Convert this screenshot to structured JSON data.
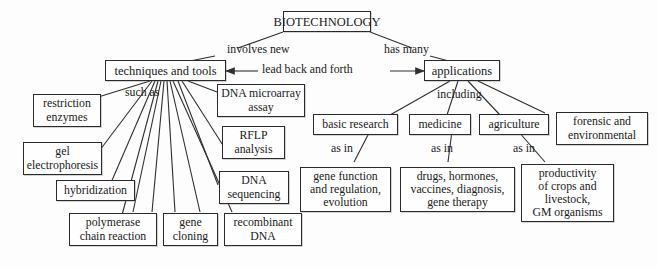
{
  "diagram": {
    "type": "concept-map",
    "root": "BIOTECHNOLOGY",
    "nodes": {
      "root": "BIOTECHNOLOGY",
      "techniques": "techniques and tools",
      "applications": "applications",
      "restriction_enzymes": "restriction\nenzymes",
      "gel_electrophoresis": "gel\nelectrophoresis",
      "hybridization": "hybridization",
      "polymerase": "polymerase\nchain reaction",
      "gene_cloning": "gene\ncloning",
      "recombinant_dna": "recombinant\nDNA",
      "dna_microarray": "DNA microarray\nassay",
      "rflp": "RFLP\nanalysis",
      "dna_sequencing": "DNA\nsequencing",
      "basic_research": "basic research",
      "medicine": "medicine",
      "agriculture": "agriculture",
      "forensic": "forensic and\nenvironmental",
      "gene_function": "gene function\nand regulation,\nevolution",
      "drugs": "drugs, hormones,\nvaccines, diagnosis,\ngene therapy",
      "productivity": "productivity\nof crops and\nlivestock,\nGM organisms"
    },
    "edge_labels": {
      "involves_new": "involves new",
      "has_many": "has many",
      "lead_back_and_forth": "lead back and forth",
      "such_as": "such as",
      "including": "including",
      "as_in_1": "as in",
      "as_in_2": "as in",
      "as_in_3": "as in"
    },
    "colors": {
      "background": "#fdfdfd",
      "box_border": "#2a2a2a",
      "box_fill": "#fefefe",
      "line": "#2f2f2f",
      "text": "#1a1a1a"
    }
  }
}
